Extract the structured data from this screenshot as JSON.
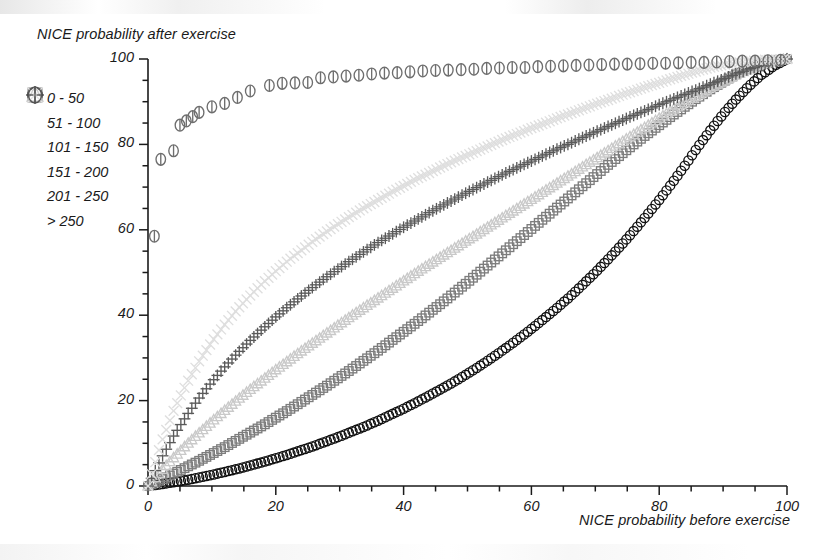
{
  "chart_data": {
    "type": "scatter",
    "title": "",
    "xlabel": "NICE probability before exercise",
    "ylabel": "NICE probability after exercise",
    "xlim": [
      0,
      100
    ],
    "ylim": [
      0,
      100
    ],
    "grid": false,
    "legend_position": "upper-left-outside",
    "x_ticks": [
      "0",
      "20",
      "40",
      "60",
      "80",
      "100"
    ],
    "x_tick_values": [
      0,
      20,
      40,
      60,
      80,
      100
    ],
    "y_ticks": [
      "0",
      "20",
      "40",
      "60",
      "80",
      "100"
    ],
    "y_tick_values": [
      0,
      20,
      40,
      60,
      80,
      100
    ],
    "minor_tick_step": 5,
    "series": [
      {
        "name": "0 - 50",
        "marker": "circle",
        "color": "#111111",
        "x": [
          0,
          2,
          4,
          6,
          8,
          10,
          12,
          14,
          16,
          18,
          20,
          22,
          24,
          26,
          28,
          30,
          32,
          34,
          36,
          38,
          40,
          42,
          44,
          46,
          48,
          50,
          52,
          54,
          56,
          58,
          60,
          62,
          64,
          66,
          68,
          70,
          72,
          74,
          76,
          78,
          80,
          82,
          84,
          86,
          88,
          90,
          92,
          94,
          96,
          98,
          100
        ],
        "y": [
          0,
          0.4,
          0.9,
          1.4,
          2.0,
          2.6,
          3.3,
          4.0,
          4.8,
          5.6,
          6.5,
          7.4,
          8.4,
          9.4,
          10.5,
          11.6,
          12.8,
          14.0,
          15.3,
          16.7,
          18.1,
          19.6,
          21.2,
          22.8,
          24.5,
          26.3,
          28.2,
          30.2,
          32.3,
          34.5,
          36.8,
          39.2,
          41.7,
          44.3,
          47.1,
          50.0,
          53.1,
          56.3,
          59.7,
          63.3,
          67.0,
          70.9,
          75.0,
          79.3,
          83.3,
          87.1,
          90.5,
          93.6,
          96.3,
          98.4,
          100
        ]
      },
      {
        "name": "51 - 100",
        "marker": "square",
        "color": "#7d7d7d",
        "x": [
          0,
          2,
          4,
          6,
          8,
          10,
          12,
          14,
          16,
          18,
          20,
          22,
          24,
          26,
          28,
          30,
          32,
          34,
          36,
          38,
          40,
          42,
          44,
          46,
          48,
          50,
          52,
          54,
          56,
          58,
          60,
          62,
          64,
          66,
          68,
          70,
          72,
          74,
          76,
          78,
          80,
          82,
          84,
          86,
          88,
          90,
          92,
          94,
          96,
          98,
          100
        ],
        "y": [
          0,
          1.4,
          2.9,
          4.4,
          5.9,
          7.5,
          9.1,
          10.8,
          12.5,
          14.2,
          16.0,
          17.8,
          19.7,
          21.6,
          23.5,
          25.5,
          27.5,
          29.6,
          31.7,
          33.9,
          36.1,
          38.3,
          40.6,
          42.9,
          45.3,
          47.7,
          50.2,
          52.7,
          55.2,
          57.7,
          60.2,
          62.7,
          65.2,
          67.7,
          70.2,
          72.7,
          75.2,
          77.6,
          80.0,
          82.3,
          84.5,
          86.7,
          88.8,
          90.9,
          92.9,
          94.7,
          96.4,
          97.8,
          98.9,
          99.6,
          100
        ]
      },
      {
        "name": "101 - 150",
        "marker": "triangle",
        "color": "#c9c9c9",
        "x": [
          0,
          2,
          4,
          6,
          8,
          10,
          12,
          14,
          16,
          18,
          20,
          22,
          24,
          26,
          28,
          30,
          32,
          34,
          36,
          38,
          40,
          42,
          44,
          46,
          48,
          50,
          52,
          54,
          56,
          58,
          60,
          62,
          64,
          66,
          68,
          70,
          72,
          74,
          76,
          78,
          80,
          82,
          84,
          86,
          88,
          90,
          92,
          94,
          96,
          98,
          100
        ],
        "y": [
          0,
          3.4,
          6.6,
          9.6,
          12.4,
          15.1,
          17.7,
          20.2,
          22.6,
          24.9,
          27.2,
          29.4,
          31.6,
          33.7,
          35.8,
          37.9,
          40.0,
          42.0,
          44.0,
          46.0,
          48.0,
          50.0,
          51.9,
          53.8,
          55.7,
          57.6,
          59.5,
          61.4,
          63.3,
          65.2,
          67.1,
          69.0,
          70.9,
          72.8,
          74.7,
          76.6,
          78.5,
          80.4,
          82.3,
          84.2,
          86.1,
          88.0,
          89.8,
          91.5,
          93.2,
          94.8,
          96.3,
          97.6,
          98.7,
          99.5,
          100
        ]
      },
      {
        "name": "151 - 200",
        "marker": "plus",
        "color": "#5a5a5a",
        "x": [
          0,
          2,
          4,
          6,
          8,
          10,
          12,
          14,
          16,
          18,
          20,
          22,
          24,
          26,
          28,
          30,
          32,
          34,
          36,
          38,
          40,
          42,
          44,
          46,
          48,
          50,
          52,
          54,
          56,
          58,
          60,
          62,
          64,
          66,
          68,
          70,
          72,
          74,
          76,
          78,
          80,
          82,
          84,
          86,
          88,
          90,
          92,
          94,
          96,
          98,
          100
        ],
        "y": [
          0,
          6.3,
          11.7,
          16.4,
          20.6,
          24.4,
          27.9,
          31.1,
          34.1,
          36.9,
          39.6,
          42.1,
          44.5,
          46.8,
          49.0,
          51.1,
          53.1,
          55.1,
          57.0,
          58.8,
          60.6,
          62.3,
          64.0,
          65.6,
          67.2,
          68.8,
          70.3,
          71.8,
          73.3,
          74.7,
          76.1,
          77.5,
          78.9,
          80.2,
          81.6,
          82.9,
          84.2,
          85.5,
          86.8,
          88.0,
          89.3,
          90.5,
          91.7,
          92.9,
          94.1,
          95.3,
          96.5,
          97.6,
          98.5,
          99.3,
          100
        ]
      },
      {
        "name": "201 - 250",
        "marker": "x",
        "color": "#dedede",
        "x": [
          0,
          2,
          4,
          6,
          8,
          10,
          12,
          14,
          16,
          18,
          20,
          22,
          24,
          26,
          28,
          30,
          32,
          34,
          36,
          38,
          40,
          42,
          44,
          46,
          48,
          50,
          52,
          54,
          56,
          58,
          60,
          62,
          64,
          66,
          68,
          70,
          72,
          74,
          76,
          78,
          80,
          82,
          84,
          86,
          88,
          90,
          92,
          94,
          96,
          98,
          100
        ],
        "y": [
          0,
          9.8,
          17.6,
          23.9,
          29.2,
          33.8,
          37.8,
          41.4,
          44.6,
          47.6,
          50.3,
          52.9,
          55.2,
          57.5,
          59.6,
          61.6,
          63.5,
          65.3,
          67.0,
          68.7,
          70.3,
          71.9,
          73.3,
          74.8,
          76.2,
          77.5,
          78.8,
          80.1,
          81.4,
          82.6,
          83.8,
          84.9,
          86.1,
          87.2,
          88.3,
          89.4,
          90.4,
          91.5,
          92.5,
          93.5,
          94.4,
          95.4,
          96.3,
          97.2,
          98.0,
          98.6,
          99.1,
          99.5,
          99.8,
          99.9,
          100
        ]
      },
      {
        "name": "> 250",
        "marker": "circle-bar",
        "color": "#6e6e6e",
        "x": [
          1,
          2,
          4,
          5,
          6,
          7,
          8,
          10,
          12,
          14,
          16,
          19,
          21,
          23,
          25,
          27,
          29,
          31,
          33,
          35,
          37,
          39,
          41,
          43,
          45,
          47,
          49,
          51,
          53,
          55,
          57,
          59,
          61,
          63,
          65,
          67,
          69,
          71,
          73,
          75,
          77,
          79,
          81,
          83,
          85,
          87,
          89,
          91,
          93,
          95,
          97,
          99
        ],
        "y": [
          58.5,
          76.5,
          78.5,
          84.5,
          85.5,
          86.5,
          87.5,
          88.8,
          89.6,
          91.0,
          92.5,
          93.8,
          94.3,
          94.4,
          94.5,
          95.6,
          95.8,
          96.0,
          96.2,
          96.5,
          96.7,
          96.8,
          97.0,
          97.2,
          97.3,
          97.4,
          97.5,
          97.6,
          97.8,
          97.9,
          98.0,
          98.0,
          98.2,
          98.3,
          98.4,
          98.5,
          98.6,
          98.7,
          98.8,
          98.8,
          98.9,
          99.0,
          99.0,
          99.1,
          99.2,
          99.2,
          99.3,
          99.4,
          99.5,
          99.5,
          99.6,
          99.7
        ]
      }
    ]
  },
  "legend": {
    "items": [
      {
        "label": "0 - 50",
        "marker": "circle",
        "color": "#111111"
      },
      {
        "label": "51 - 100",
        "marker": "square",
        "color": "#6e6e6e"
      },
      {
        "label": "101 - 150",
        "marker": "triangle",
        "color": "#c4c4c4"
      },
      {
        "label": "151 - 200",
        "marker": "plus",
        "color": "#4a4a4a"
      },
      {
        "label": "201 - 250",
        "marker": "x",
        "color": "#e2e2e2"
      },
      {
        "label": "> 250",
        "marker": "circle-bar",
        "color": "#555555"
      }
    ]
  },
  "axes": {
    "x_label": "NICE probability before exercise",
    "y_label": "NICE probability after exercise"
  },
  "colors": {
    "axis": "#1a1a1a",
    "background": "#ffffff"
  }
}
